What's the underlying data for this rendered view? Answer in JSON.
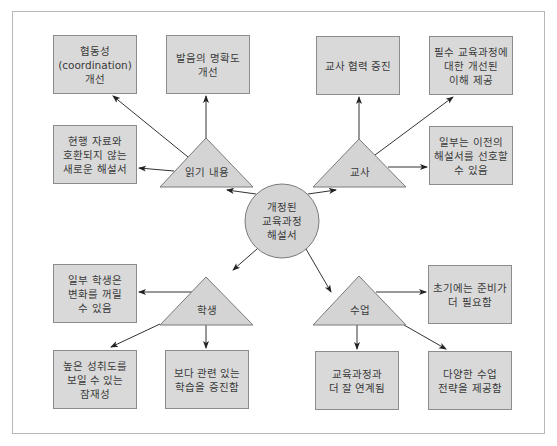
{
  "diagram": {
    "hub": {
      "label": "개정된\n교육과정\n해설서",
      "cx": 282,
      "cy": 221,
      "r": 37
    },
    "categories": [
      {
        "id": "reading",
        "label": "읽기 내용",
        "apex": [
          206,
          138
        ],
        "base_left": [
          160,
          187
        ],
        "base_right": [
          253,
          187
        ],
        "outcomes": [
          {
            "label": "협동성\n(coordination)\n개선",
            "x": 53,
            "y": 35
          },
          {
            "label": "발음의 명확도\n개선",
            "x": 166,
            "y": 35
          },
          {
            "label": "현행 자료와\n호환되지 않는\n새로운 해설서",
            "x": 53,
            "y": 125
          }
        ]
      },
      {
        "id": "teacher",
        "label": "교사",
        "apex": [
          359,
          139
        ],
        "base_left": [
          313,
          187
        ],
        "base_right": [
          406,
          187
        ],
        "outcomes": [
          {
            "label": "교사 협력 증진",
            "x": 316,
            "y": 36
          },
          {
            "label": "필수 교육과정에\n대한 개선된\n이해 제공",
            "x": 429,
            "y": 36
          },
          {
            "label": "일부는 이전의\n해설서를 선호할\n수 있음",
            "x": 429,
            "y": 126
          }
        ]
      },
      {
        "id": "student",
        "label": "학생",
        "apex": [
          206,
          277
        ],
        "base_left": [
          160,
          325
        ],
        "base_right": [
          253,
          325
        ],
        "outcomes": [
          {
            "label": "일부 학생은\n변화를 꺼릴\n수 있음",
            "x": 53,
            "y": 264
          },
          {
            "label": "높은 성취도를\n보일 수 있는\n잠재성",
            "x": 53,
            "y": 350
          },
          {
            "label": "보다 관련 있는\n학습을 증진함",
            "x": 165,
            "y": 350
          }
        ]
      },
      {
        "id": "instruction",
        "label": "수업",
        "apex": [
          359,
          276
        ],
        "base_left": [
          313,
          325
        ],
        "base_right": [
          406,
          325
        ],
        "outcomes": [
          {
            "label": "초기에는 준비가\n더 필요함",
            "x": 428,
            "y": 265
          },
          {
            "label": "교육과정과\n더 잘 연계됨",
            "x": 315,
            "y": 351
          },
          {
            "label": "다양한 수업\n전략을 제공함",
            "x": 428,
            "y": 351
          }
        ]
      }
    ],
    "colors": {
      "box_fill": "#d9d9d9",
      "box_border": "#8c8c8c",
      "shape_fill": "#d4d4d4",
      "shape_border": "#7a7a7a",
      "arrow": "#333333",
      "frame": "#b8b8b8",
      "text": "#3a3a3a"
    }
  }
}
